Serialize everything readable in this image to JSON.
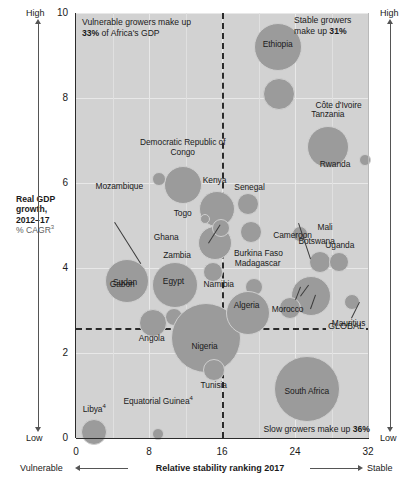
{
  "chart_data": {
    "type": "scatter",
    "title": "",
    "xlabel": "Relative stability ranking 2017",
    "ylabel": "Real GDP growth, 2012–17",
    "ylabel_unit": "% CAGR",
    "ylabel_unit_sup": "3",
    "xlim": [
      0,
      32
    ],
    "ylim": [
      0,
      10
    ],
    "xticks": [
      "0",
      "8",
      "16",
      "24",
      "32"
    ],
    "yticks": [
      "0",
      "2",
      "4",
      "6",
      "8",
      "10"
    ],
    "grid": true,
    "legend": "none",
    "bubble_size_meaning": "GDP size",
    "reference_lines": {
      "vertical_median_x": 16,
      "horizontal_global_y": 2.6,
      "global_label": "GLOBAL"
    },
    "points": [
      {
        "name": "Ethiopia",
        "x": 22.1,
        "y": 9.2,
        "r": 24
      },
      {
        "name": "Côte d'Ivoire",
        "x": 22.3,
        "y": 8.1,
        "r": 16
      },
      {
        "name": "Tanzania",
        "x": 27.6,
        "y": 6.85,
        "r": 21
      },
      {
        "name": "Rwanda",
        "x": 31.7,
        "y": 6.55,
        "r": 6
      },
      {
        "name": "Democratic Republic of Congo",
        "x": 11.7,
        "y": 5.95,
        "r": 19
      },
      {
        "name": "Mozambique",
        "x": 9.1,
        "y": 6.1,
        "r": 7
      },
      {
        "name": "Kenya",
        "x": 15.4,
        "y": 5.4,
        "r": 18
      },
      {
        "name": "Senegal",
        "x": 18.8,
        "y": 5.5,
        "r": 11
      },
      {
        "name": "Togo",
        "x": 14.1,
        "y": 5.15,
        "r": 5
      },
      {
        "name": "Ghana",
        "x": 15.2,
        "y": 4.6,
        "r": 17
      },
      {
        "name": "Burkina Faso",
        "x": 15.9,
        "y": 4.95,
        "r": 9
      },
      {
        "name": "Cameroon",
        "x": 19.2,
        "y": 4.85,
        "r": 11
      },
      {
        "name": "Mali",
        "x": 24.6,
        "y": 4.8,
        "r": 8
      },
      {
        "name": "Botswana",
        "x": 26.7,
        "y": 4.15,
        "r": 11
      },
      {
        "name": "Uganda",
        "x": 28.8,
        "y": 4.15,
        "r": 10
      },
      {
        "name": "Zambia",
        "x": 15.0,
        "y": 3.9,
        "r": 10
      },
      {
        "name": "Namibia",
        "x": 19.5,
        "y": 3.55,
        "r": 9
      },
      {
        "name": "Madagascar",
        "x": 25.8,
        "y": 3.35,
        "r": 20
      },
      {
        "name": "Morocco",
        "x": 23.4,
        "y": 3.05,
        "r": 11
      },
      {
        "name": "Mauritius",
        "x": 30.2,
        "y": 3.2,
        "r": 8
      },
      {
        "name": "Sudan",
        "x": 5.6,
        "y": 3.7,
        "r": 22
      },
      {
        "name": "Egypt",
        "x": 10.9,
        "y": 3.6,
        "r": 23
      },
      {
        "name": "Gabon",
        "x": 10.7,
        "y": 2.85,
        "r": 9
      },
      {
        "name": "Angola",
        "x": 8.4,
        "y": 2.7,
        "r": 14
      },
      {
        "name": "Nigeria",
        "x": 14.3,
        "y": 2.35,
        "r": 35
      },
      {
        "name": "Algeria",
        "x": 18.8,
        "y": 2.95,
        "r": 22
      },
      {
        "name": "Tunisia",
        "x": 15.1,
        "y": 1.6,
        "r": 11
      },
      {
        "name": "South Africa",
        "x": 25.3,
        "y": 1.15,
        "r": 33
      },
      {
        "name": "Libya",
        "x": 2.0,
        "y": 0.15,
        "r": 13,
        "footnote": "4"
      },
      {
        "name": "Equatorial Guinea",
        "x": 9.0,
        "y": 0.1,
        "r": 6,
        "footnote": "4"
      }
    ]
  },
  "annotations": {
    "vulnerable_callout_line1": "Vulnerable growers make up",
    "vulnerable_callout_pct": "33%",
    "vulnerable_callout_line2": " of Africa's GDP",
    "stable_callout_line1": "Stable growers",
    "stable_callout_line2": "make up ",
    "stable_callout_pct": "31%",
    "slow_callout_line1": "Slow growers make up ",
    "slow_callout_pct": "36%",
    "global_line_label": "GLOBAL"
  },
  "edges": {
    "left_top": "High",
    "left_bottom": "Low",
    "right_top": "High",
    "right_bottom": "Low",
    "bottom_left": "Vulnerable",
    "bottom_right": "Stable"
  },
  "axes": {
    "y_title_line1": "Real GDP",
    "y_title_line2": "growth,",
    "y_title_line3": "2012–17",
    "y_title_unit": "% CAGR",
    "y_title_unit_sup": "3",
    "x_title": "Relative stability ranking 2017"
  }
}
